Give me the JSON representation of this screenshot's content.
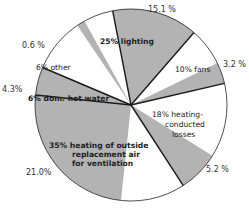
{
  "chart_data": {
    "type": "pie",
    "title": "",
    "center": [
      131,
      105
    ],
    "radius": 96,
    "colors": {
      "gray": "#b3b3b3",
      "white": "#ffffff",
      "line": "#1a1a1a"
    },
    "categories": [
      "lighting",
      "fans",
      "heating-conducted losses",
      "heating of outside replacement air for ventilation",
      "dom. hot water",
      "other"
    ],
    "values": [
      25,
      10,
      18,
      35,
      6,
      6
    ],
    "sub_values": [
      15.1,
      3.2,
      5.2,
      21.0,
      4.3,
      0.6
    ],
    "slices": [
      {
        "name": "lighting",
        "pct": 25,
        "label": "25% lighting",
        "sub_pct": 15.1,
        "sub_label": "15.1 %",
        "start": -101,
        "end": -49,
        "fill": "gray",
        "sub_start": -101,
        "sub_end": -49
      },
      {
        "name": "fans",
        "pct": 10,
        "label": "10% fans",
        "sub_pct": 3.2,
        "sub_label": "3.2 %",
        "start": -49,
        "end": -13,
        "fill": "white",
        "sub_start": -26,
        "sub_end": -13
      },
      {
        "name": "heating-conducted losses",
        "pct": 18,
        "label_lines": [
          "18% heating-",
          "conducted",
          "losses"
        ],
        "sub_pct": 5.2,
        "sub_label": "5.2 %",
        "start": -13,
        "end": 57,
        "fill": "white",
        "sub_start": 32,
        "sub_end": 57
      },
      {
        "name": "heating of outside replacement air for ventilation",
        "pct": 35,
        "label_lines": [
          "35% heating of outside",
          "replacement air",
          "for ventilation"
        ],
        "sub_pct": 21.0,
        "sub_label": "21.0%",
        "start": 57,
        "end": 186,
        "fill": "white",
        "sub_start": 96,
        "sub_end": 186
      },
      {
        "name": "dom. hot water",
        "pct": 6,
        "label": "6% dom. hot water",
        "sub_pct": 4.3,
        "sub_label": "4.3%",
        "start": 186,
        "end": 203,
        "fill": "white",
        "sub_start": 186,
        "sub_end": 203
      },
      {
        "name": "other",
        "pct": 6,
        "label": "6% other",
        "sub_pct": 0.6,
        "sub_label": "0.6 %",
        "start": 203,
        "end": 259,
        "fill": "white",
        "sub_start": 236,
        "sub_end": 241
      }
    ]
  }
}
